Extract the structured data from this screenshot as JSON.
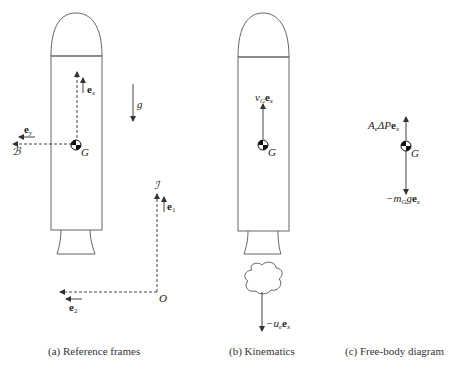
{
  "panels": {
    "a": {
      "caption": "(a) Reference frames",
      "labels": {
        "ex_base": "e",
        "ex_sub": "x",
        "ey_base": "e",
        "ey_sub": "y",
        "B": "ℬ",
        "G": "G",
        "g": "g",
        "I": "ℐ",
        "e1_base": "e",
        "e1_sub": "1",
        "e2_base": "e",
        "e2_sub": "2",
        "O": "O"
      }
    },
    "b": {
      "caption": "(b) Kinematics",
      "labels": {
        "v": "v",
        "v_sub": "G",
        "ex_base": "e",
        "ex_sub": "x",
        "G": "G",
        "minus_u": "−u",
        "u_sub": "e",
        "ue_ex_base": "e",
        "ue_ex_sub": "x"
      }
    },
    "c": {
      "caption": "(c) Free-body diagram",
      "labels": {
        "A": "A",
        "A_sub": "e",
        "dP": "ΔP",
        "thrust_e": "e",
        "thrust_sub": "x",
        "G": "G",
        "minus_m": "−m",
        "m_sub": "G",
        "g": "g",
        "grav_e": "e",
        "grav_sub": "x"
      }
    }
  },
  "colors": {
    "stroke": "#555555",
    "text": "#222222"
  }
}
